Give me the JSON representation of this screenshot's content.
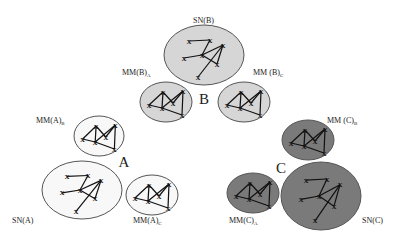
{
  "diagram": {
    "colors": {
      "white": "#f8f8f8",
      "light": "#d6d6d6",
      "dark": "#7a7a7a",
      "stroke": "#555555"
    },
    "groups": [
      {
        "id": "A",
        "label": "A",
        "label_pos": [
          124,
          167
        ]
      },
      {
        "id": "B",
        "label": "B",
        "label_pos": [
          204,
          104
        ]
      },
      {
        "id": "C",
        "label": "C",
        "label_pos": [
          281,
          173
        ]
      }
    ],
    "ellipses": [
      {
        "id": "SN(B)",
        "label": "SN(B)",
        "sub": "",
        "group": "B",
        "fill": "light",
        "cx": 204,
        "cy": 55,
        "rx": 40,
        "ry": 30,
        "label_pos": [
          193,
          23
        ],
        "kind": "SN"
      },
      {
        "id": "MM(B)A",
        "label": "MM(B)",
        "sub": "A",
        "group": "B",
        "fill": "light",
        "cx": 166,
        "cy": 102,
        "rx": 26,
        "ry": 20,
        "label_pos": [
          122,
          75
        ],
        "kind": "MM"
      },
      {
        "id": "MM(B)C",
        "label": "MM (B)",
        "sub": "C",
        "group": "B",
        "fill": "light",
        "cx": 244,
        "cy": 102,
        "rx": 26,
        "ry": 20,
        "label_pos": [
          253,
          75
        ],
        "kind": "MM"
      },
      {
        "id": "MM(A)B",
        "label": "MM(A)",
        "sub": "B",
        "group": "A",
        "fill": "white",
        "cx": 99,
        "cy": 136,
        "rx": 25,
        "ry": 20,
        "label_pos": [
          36,
          123
        ],
        "kind": "MM"
      },
      {
        "id": "SN(A)",
        "label": "SN(A)",
        "sub": "",
        "group": "A",
        "fill": "white",
        "cx": 82,
        "cy": 190,
        "rx": 40,
        "ry": 29,
        "label_pos": [
          12,
          223
        ],
        "kind": "SN"
      },
      {
        "id": "MM(A)C",
        "label": "MM(A)",
        "sub": "C",
        "group": "A",
        "fill": "white",
        "cx": 152,
        "cy": 195,
        "rx": 26,
        "ry": 20,
        "label_pos": [
          133,
          223
        ],
        "kind": "MM"
      },
      {
        "id": "MM(C)B",
        "label": "MM (C)",
        "sub": "B",
        "group": "C",
        "fill": "dark",
        "cx": 308,
        "cy": 140,
        "rx": 26,
        "ry": 20,
        "label_pos": [
          327,
          123
        ],
        "kind": "MM"
      },
      {
        "id": "MM(C)A",
        "label": "MM(C)",
        "sub": "A",
        "group": "C",
        "fill": "dark",
        "cx": 253,
        "cy": 193,
        "rx": 26,
        "ry": 20,
        "label_pos": [
          229,
          223
        ],
        "kind": "MM"
      },
      {
        "id": "SN(C)",
        "label": "SN(C)",
        "sub": "",
        "group": "C",
        "fill": "dark",
        "cx": 321,
        "cy": 196,
        "rx": 40,
        "ry": 34,
        "label_pos": [
          362,
          223
        ],
        "kind": "SN"
      }
    ],
    "node_glyph": "X",
    "graphs": {
      "SN": {
        "nodes": [
          [
            -15,
            -14
          ],
          [
            6,
            -15
          ],
          [
            -20,
            3
          ],
          [
            -2,
            0
          ],
          [
            19,
            -10
          ],
          [
            13,
            9
          ],
          [
            -6,
            22
          ]
        ],
        "edges": [
          [
            0,
            1
          ],
          [
            1,
            3
          ],
          [
            2,
            3
          ],
          [
            3,
            4
          ],
          [
            3,
            5
          ],
          [
            4,
            5
          ],
          [
            4,
            6
          ]
        ]
      },
      "MM": {
        "nodes": [
          [
            -17,
            3
          ],
          [
            -3,
            -10
          ],
          [
            17,
            -11
          ],
          [
            -4,
            6
          ],
          [
            7,
            1
          ],
          [
            16,
            13
          ]
        ],
        "edges": [
          [
            0,
            1
          ],
          [
            1,
            4
          ],
          [
            4,
            2
          ],
          [
            2,
            5
          ],
          [
            3,
            5
          ],
          [
            1,
            3
          ],
          [
            3,
            2
          ],
          [
            0,
            3
          ]
        ]
      }
    }
  }
}
